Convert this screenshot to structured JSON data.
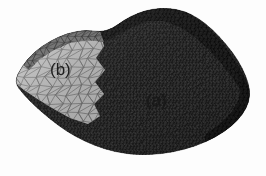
{
  "figure": {
    "kind": "finite-element-mesh-render",
    "width": 266,
    "height": 176,
    "background_color": "#fdfdfd"
  },
  "labels": {
    "region_a": "(a)",
    "region_b": "(b)"
  },
  "regions": [
    {
      "id": "region-a",
      "label": "(a)",
      "fill_color": "#3a3a3a",
      "edge_color": "#161616",
      "mesh_density": "fine",
      "approx_element_size_px": 3.2,
      "label_position": {
        "x": 146,
        "y": 92
      }
    },
    {
      "id": "region-b",
      "label": "(b)",
      "fill_color": "#bdbdbd",
      "edge_color": "#6d6d6d",
      "mesh_density": "coarse",
      "approx_element_size_px": 11.0,
      "label_position": {
        "x": 50,
        "y": 61
      }
    },
    {
      "id": "top-ridge-band",
      "label": "",
      "fill_color": "#222222",
      "edge_color": "#0d0d0d",
      "mesh_density": "fine",
      "approx_element_size_px": 4.0,
      "label_position": null
    },
    {
      "id": "upper-fold-band-b",
      "label": "",
      "fill_color": "#6f6f6f",
      "edge_color": "#3c3c3c",
      "mesh_density": "medium",
      "approx_element_size_px": 7.0,
      "label_position": null
    },
    {
      "id": "right-side-wall",
      "label": "",
      "fill_color": "#1e1e1e",
      "edge_color": "#0a0a0a",
      "mesh_density": "fine",
      "approx_element_size_px": 4.0,
      "label_position": null
    }
  ],
  "palette": {
    "page_background": "#fdfdfd",
    "region_a_fill": "#3a3a3a",
    "region_a_edge": "#161616",
    "region_b_fill": "#bdbdbd",
    "region_b_edge": "#6d6d6d",
    "ridge_dark": "#222222",
    "fold_mid_gray": "#6f6f6f",
    "side_wall": "#1e1e1e",
    "label_text": "#1a1a1a",
    "bleed_through": "#d9d9dd"
  },
  "scan_artifacts": {
    "bleed_through_visible": true,
    "bleed_through_lines": [
      "       ",
      "      ",
      "     ",
      "    "
    ]
  },
  "geometry": {
    "outline_polygon": [
      [
        14,
        82
      ],
      [
        22,
        66
      ],
      [
        34,
        52
      ],
      [
        50,
        41
      ],
      [
        68,
        33
      ],
      [
        86,
        30
      ],
      [
        100,
        32
      ],
      [
        112,
        29
      ],
      [
        124,
        20
      ],
      [
        138,
        13
      ],
      [
        152,
        9
      ],
      [
        168,
        8
      ],
      [
        184,
        11
      ],
      [
        198,
        18
      ],
      [
        212,
        29
      ],
      [
        226,
        44
      ],
      [
        238,
        60
      ],
      [
        246,
        76
      ],
      [
        250,
        90
      ],
      [
        249,
        102
      ],
      [
        243,
        114
      ],
      [
        232,
        126
      ],
      [
        216,
        137
      ],
      [
        196,
        146
      ],
      [
        174,
        152
      ],
      [
        150,
        155
      ],
      [
        126,
        154
      ],
      [
        104,
        149
      ],
      [
        84,
        141
      ],
      [
        66,
        131
      ],
      [
        50,
        119
      ],
      [
        36,
        107
      ],
      [
        24,
        95
      ]
    ],
    "region_boundary_zigzag_x_range": [
      92,
      118
    ],
    "region_b_polygon": [
      [
        14,
        82
      ],
      [
        22,
        66
      ],
      [
        34,
        52
      ],
      [
        50,
        41
      ],
      [
        68,
        33
      ],
      [
        86,
        30
      ],
      [
        100,
        32
      ],
      [
        104,
        46
      ],
      [
        96,
        58
      ],
      [
        105,
        70
      ],
      [
        95,
        82
      ],
      [
        104,
        94
      ],
      [
        94,
        104
      ],
      [
        100,
        116
      ],
      [
        88,
        124
      ],
      [
        70,
        118
      ],
      [
        52,
        108
      ],
      [
        36,
        98
      ],
      [
        24,
        90
      ]
    ]
  }
}
